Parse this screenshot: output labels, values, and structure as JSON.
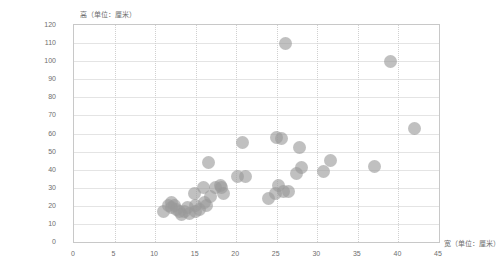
{
  "chart_data": {
    "type": "scatter",
    "title": "",
    "xlabel": "宽（单位：厘米）",
    "ylabel": "高（单位：厘米）",
    "xlim": [
      0,
      45
    ],
    "ylim": [
      0,
      120
    ],
    "xticks": [
      0,
      5,
      10,
      15,
      20,
      25,
      30,
      35,
      40,
      45
    ],
    "yticks": [
      0,
      10,
      20,
      30,
      40,
      50,
      60,
      70,
      80,
      90,
      100,
      110,
      120
    ],
    "grid": true,
    "grid_style": {
      "vertical": "dotted",
      "horizontal": "solid"
    },
    "legend": "none",
    "marker": {
      "shape": "circle",
      "color": "#9a9a9a",
      "opacity": 0.62,
      "size_px": 13
    },
    "points": [
      {
        "x": 11.0,
        "y": 17
      },
      {
        "x": 11.7,
        "y": 20
      },
      {
        "x": 12.0,
        "y": 22
      },
      {
        "x": 12.0,
        "y": 19
      },
      {
        "x": 12.4,
        "y": 20
      },
      {
        "x": 12.6,
        "y": 18
      },
      {
        "x": 13.0,
        "y": 17
      },
      {
        "x": 13.2,
        "y": 15
      },
      {
        "x": 13.6,
        "y": 17
      },
      {
        "x": 14.0,
        "y": 19
      },
      {
        "x": 14.3,
        "y": 16
      },
      {
        "x": 14.8,
        "y": 27
      },
      {
        "x": 15.0,
        "y": 20
      },
      {
        "x": 15.0,
        "y": 17
      },
      {
        "x": 15.5,
        "y": 18
      },
      {
        "x": 16.0,
        "y": 30
      },
      {
        "x": 16.1,
        "y": 22
      },
      {
        "x": 16.3,
        "y": 20
      },
      {
        "x": 16.6,
        "y": 44
      },
      {
        "x": 16.8,
        "y": 25
      },
      {
        "x": 17.4,
        "y": 30
      },
      {
        "x": 18.0,
        "y": 31
      },
      {
        "x": 18.2,
        "y": 30
      },
      {
        "x": 18.4,
        "y": 27
      },
      {
        "x": 20.2,
        "y": 36
      },
      {
        "x": 20.8,
        "y": 55
      },
      {
        "x": 21.2,
        "y": 36
      },
      {
        "x": 24.0,
        "y": 24
      },
      {
        "x": 24.8,
        "y": 27
      },
      {
        "x": 25.0,
        "y": 58
      },
      {
        "x": 25.2,
        "y": 31
      },
      {
        "x": 25.6,
        "y": 57
      },
      {
        "x": 25.8,
        "y": 28
      },
      {
        "x": 26.1,
        "y": 110
      },
      {
        "x": 26.5,
        "y": 28
      },
      {
        "x": 27.4,
        "y": 38
      },
      {
        "x": 27.8,
        "y": 52
      },
      {
        "x": 28.0,
        "y": 41
      },
      {
        "x": 30.8,
        "y": 39
      },
      {
        "x": 31.6,
        "y": 45
      },
      {
        "x": 37.0,
        "y": 42
      },
      {
        "x": 39.0,
        "y": 100
      },
      {
        "x": 42.0,
        "y": 63
      }
    ]
  }
}
